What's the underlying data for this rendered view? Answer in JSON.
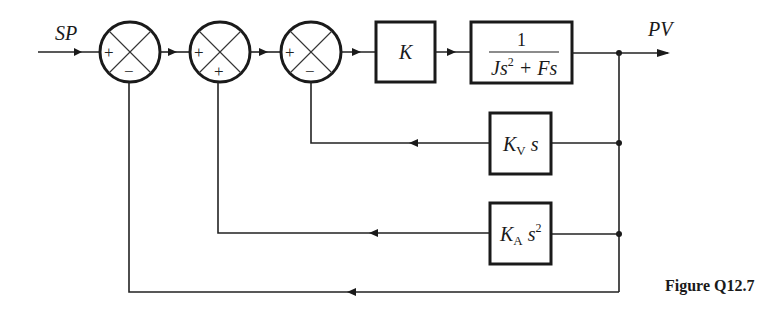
{
  "diagram": {
    "type": "control-system-block-diagram",
    "input_label": "SP",
    "output_label": "PV",
    "caption": "Figure Q12.7",
    "summing_junctions": [
      {
        "id": "sum1",
        "signs": {
          "left": "+",
          "bottom": "−"
        }
      },
      {
        "id": "sum2",
        "signs": {
          "left": "+",
          "bottom": "+"
        }
      },
      {
        "id": "sum3",
        "signs": {
          "left": "+",
          "bottom": "−"
        }
      }
    ],
    "blocks": {
      "gain": {
        "label": "K"
      },
      "plant": {
        "numerator": "1",
        "denominator_J": "Js",
        "denominator_exp": "2",
        "denominator_rest": " + Fs"
      },
      "velocity_feedback": {
        "main": "K",
        "subscript": "V",
        "suffix": " s"
      },
      "acceleration_feedback": {
        "main": "K",
        "subscript": "A",
        "suffix": " s",
        "exponent": "2"
      }
    },
    "connections": [
      "SP → sum1 (+)",
      "sum1 → sum2 (+)",
      "sum2 → sum3 (+)",
      "sum3 → K",
      "K → 1/(Js^2 + Fs)",
      "1/(Js^2 + Fs) → PV",
      "PV → K_V s → sum3 (−)",
      "PV → K_A s^2 → sum2 (+)",
      "PV → sum1 (−) (unity feedback)"
    ]
  }
}
